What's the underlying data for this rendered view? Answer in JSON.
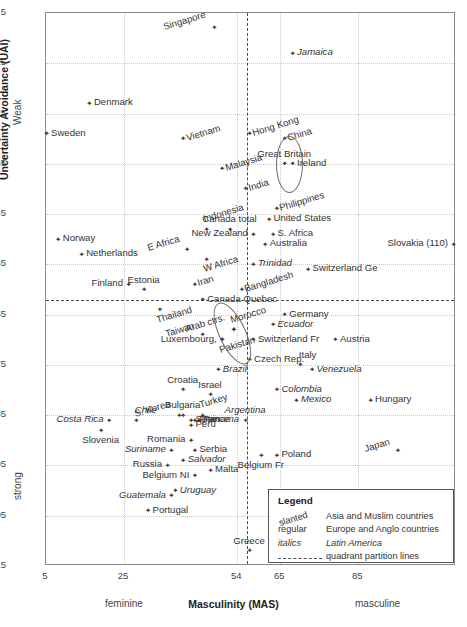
{
  "chart_data": {
    "type": "scatter",
    "title": "",
    "xlabel": "Masculinity (MAS)",
    "ylabel": "Uncertainty Avoidance (UAI)",
    "xlim": [
      5,
      110
    ],
    "ylim": [
      5,
      115
    ],
    "y_inverted": true,
    "xticks": [
      5,
      25,
      54,
      65,
      85
    ],
    "yticks": [
      5,
      15,
      25,
      35,
      45,
      55,
      65,
      75,
      85,
      95,
      105,
      115
    ],
    "x_axis_ends": {
      "low": "feminine",
      "high": "masculine"
    },
    "y_axis_ends": {
      "low": "Weak",
      "high": "strong"
    },
    "grid": true,
    "partition_lines": {
      "x": 56.5,
      "y": 62
    },
    "legend_position": "bottom-right",
    "points": [
      {
        "label": "Singapore",
        "x": 48,
        "y": 8,
        "style": "slanted",
        "pos": "left"
      },
      {
        "label": "Jamaica",
        "x": 68,
        "y": 13,
        "style": "italics",
        "pos": "right"
      },
      {
        "label": "Denmark",
        "x": 16,
        "y": 23,
        "style": "regular",
        "pos": "right"
      },
      {
        "label": "Sweden",
        "x": 5,
        "y": 29,
        "style": "regular",
        "pos": "right"
      },
      {
        "label": "Vietnam",
        "x": 40,
        "y": 30,
        "style": "slanted",
        "pos": "right"
      },
      {
        "label": "Hong Kong",
        "x": 57,
        "y": 29,
        "style": "slanted",
        "pos": "right"
      },
      {
        "label": "China",
        "x": 66,
        "y": 30,
        "style": "slanted",
        "pos": "right"
      },
      {
        "label": "Great Britain",
        "x": 66,
        "y": 35,
        "style": "regular",
        "pos": "above-c"
      },
      {
        "label": "Ireland",
        "x": 68,
        "y": 35,
        "style": "regular",
        "pos": "right"
      },
      {
        "label": "Malaysia",
        "x": 50,
        "y": 36,
        "style": "slanted",
        "pos": "right"
      },
      {
        "label": "India",
        "x": 56,
        "y": 40,
        "style": "slanted",
        "pos": "right"
      },
      {
        "label": "Philippines",
        "x": 64,
        "y": 44,
        "style": "slanted",
        "pos": "right"
      },
      {
        "label": "Indonesia",
        "x": 46,
        "y": 48,
        "style": "slanted",
        "pos": "above"
      },
      {
        "label": "Canada total",
        "x": 52,
        "y": 48,
        "style": "regular",
        "pos": "above-c"
      },
      {
        "label": "United States",
        "x": 62,
        "y": 46,
        "style": "regular",
        "pos": "right"
      },
      {
        "label": "Norway",
        "x": 8,
        "y": 50,
        "style": "regular",
        "pos": "right"
      },
      {
        "label": "New Zealand",
        "x": 58,
        "y": 49,
        "style": "regular",
        "pos": "left"
      },
      {
        "label": "S. Africa",
        "x": 63,
        "y": 49,
        "style": "regular",
        "pos": "right"
      },
      {
        "label": "Australia",
        "x": 61,
        "y": 51,
        "style": "regular",
        "pos": "right"
      },
      {
        "label": "E Africa",
        "x": 41,
        "y": 52,
        "style": "slanted",
        "pos": "left"
      },
      {
        "label": "Slovakia (110)",
        "x": 110,
        "y": 51,
        "style": "regular",
        "pos": "left"
      },
      {
        "label": "Netherlands",
        "x": 14,
        "y": 53,
        "style": "regular",
        "pos": "right"
      },
      {
        "label": "W Africa",
        "x": 46,
        "y": 54,
        "style": "slanted",
        "pos": "below"
      },
      {
        "label": "Trinidad",
        "x": 58,
        "y": 55,
        "style": "italics",
        "pos": "right"
      },
      {
        "label": "Switzerland Ge",
        "x": 72,
        "y": 56,
        "style": "regular",
        "pos": "right"
      },
      {
        "label": "Iran",
        "x": 43,
        "y": 59,
        "style": "slanted",
        "pos": "right"
      },
      {
        "label": "Finland",
        "x": 26,
        "y": 59,
        "style": "regular",
        "pos": "left"
      },
      {
        "label": "Estonia",
        "x": 30,
        "y": 60,
        "style": "regular",
        "pos": "above-c"
      },
      {
        "label": "Bangladesh",
        "x": 55,
        "y": 60,
        "style": "slanted",
        "pos": "right"
      },
      {
        "label": "Canada Quebec",
        "x": 45,
        "y": 62,
        "style": "regular",
        "pos": "right"
      },
      {
        "label": "Thailand",
        "x": 34,
        "y": 64,
        "style": "slanted",
        "pos": "below"
      },
      {
        "label": "Morocco",
        "x": 53,
        "y": 68,
        "style": "slanted",
        "pos": "above"
      },
      {
        "label": "Germany",
        "x": 66,
        "y": 65,
        "style": "regular",
        "pos": "right"
      },
      {
        "label": "Arab ctrs.",
        "x": 53,
        "y": 68,
        "style": "slanted",
        "pos": "left"
      },
      {
        "label": "Ecuador",
        "x": 63,
        "y": 67,
        "style": "italics",
        "pos": "right"
      },
      {
        "label": "Taiwan",
        "x": 45,
        "y": 69,
        "style": "slanted",
        "pos": "left"
      },
      {
        "label": "Pakistan",
        "x": 50,
        "y": 70,
        "style": "slanted",
        "pos": "below"
      },
      {
        "label": "Switzerland Fr",
        "x": 58,
        "y": 70,
        "style": "regular",
        "pos": "right"
      },
      {
        "label": "Austria",
        "x": 79,
        "y": 70,
        "style": "regular",
        "pos": "right"
      },
      {
        "label": "Luxembourg,",
        "x": 50,
        "y": 70,
        "style": "regular",
        "pos": "left"
      },
      {
        "label": "Czech Rep.",
        "x": 57,
        "y": 74,
        "style": "regular",
        "pos": "right"
      },
      {
        "label": "Italy",
        "x": 70,
        "y": 75,
        "style": "regular",
        "pos": "above"
      },
      {
        "label": "Brazil",
        "x": 49,
        "y": 76,
        "style": "italics",
        "pos": "right"
      },
      {
        "label": "Venezuela",
        "x": 73,
        "y": 76,
        "style": "italics",
        "pos": "right"
      },
      {
        "label": "Croatia",
        "x": 40,
        "y": 80,
        "style": "regular",
        "pos": "above-c"
      },
      {
        "label": "Israel",
        "x": 47,
        "y": 81,
        "style": "regular",
        "pos": "above-c"
      },
      {
        "label": "Colombia",
        "x": 64,
        "y": 80,
        "style": "italics",
        "pos": "right"
      },
      {
        "label": "Mexico",
        "x": 69,
        "y": 82,
        "style": "italics",
        "pos": "right"
      },
      {
        "label": "Hungary",
        "x": 88,
        "y": 82,
        "style": "regular",
        "pos": "right"
      },
      {
        "label": "Bulgaria",
        "x": 40,
        "y": 85,
        "style": "regular",
        "pos": "above-c"
      },
      {
        "label": "Turkey",
        "x": 45,
        "y": 85,
        "style": "slanted",
        "pos": "above"
      },
      {
        "label": "Chile",
        "x": 28,
        "y": 86,
        "style": "italics",
        "pos": "above"
      },
      {
        "label": "Costa Rica",
        "x": 21,
        "y": 86,
        "style": "italics",
        "pos": "left"
      },
      {
        "label": "Argentina",
        "x": 56,
        "y": 86,
        "style": "italics",
        "pos": "above-c"
      },
      {
        "label": "S. Korea",
        "x": 39,
        "y": 85,
        "style": "slanted",
        "pos": "left"
      },
      {
        "label": "France",
        "x": 43,
        "y": 86,
        "style": "regular",
        "pos": "right"
      },
      {
        "label": "Slovenia",
        "x": 19,
        "y": 88,
        "style": "regular",
        "pos": "below-c"
      },
      {
        "label": "Peru",
        "x": 42,
        "y": 87,
        "style": "left"
      },
      {
        "label": "Spain",
        "x": 42,
        "y": 86,
        "style": "regular",
        "pos": "right"
      },
      {
        "label": "Panama",
        "x": 44,
        "y": 86,
        "style": "italics",
        "pos": "right"
      },
      {
        "label": "Romania",
        "x": 42,
        "y": 90,
        "style": "regular",
        "pos": "left"
      },
      {
        "label": "Suriname",
        "x": 37,
        "y": 92,
        "style": "italics",
        "pos": "left"
      },
      {
        "label": "Serbia",
        "x": 43,
        "y": 92,
        "style": "regular",
        "pos": "right"
      },
      {
        "label": "Russia",
        "x": 36,
        "y": 95,
        "style": "regular",
        "pos": "left"
      },
      {
        "label": "Salvador",
        "x": 40,
        "y": 94,
        "style": "italics",
        "pos": "right"
      },
      {
        "label": "Belgium NI",
        "x": 43,
        "y": 97,
        "style": "regular",
        "pos": "left"
      },
      {
        "label": "Malta",
        "x": 47,
        "y": 96,
        "style": "regular",
        "pos": "right"
      },
      {
        "label": "Belgium Fr",
        "x": 60,
        "y": 93,
        "style": "regular",
        "pos": "below-c"
      },
      {
        "label": "Poland",
        "x": 64,
        "y": 93,
        "style": "regular",
        "pos": "right"
      },
      {
        "label": "Japan",
        "x": 95,
        "y": 92,
        "style": "slanted",
        "pos": "left"
      },
      {
        "label": "Guatemala",
        "x": 37,
        "y": 101,
        "style": "italics",
        "pos": "left"
      },
      {
        "label": "Uruguay",
        "x": 38,
        "y": 100,
        "style": "italics",
        "pos": "right"
      },
      {
        "label": "Portugal",
        "x": 31,
        "y": 104,
        "style": "regular",
        "pos": "right"
      },
      {
        "label": "Greece",
        "x": 57,
        "y": 112,
        "style": "regular",
        "pos": "above-c"
      }
    ],
    "annotations": [
      {
        "type": "ellipse",
        "center_x": 67,
        "center_y": 35,
        "rx": 3.2,
        "ry": 5.5
      },
      {
        "type": "ellipse",
        "center_x": 52.5,
        "center_y": 68.5,
        "rx": 3.2,
        "ry": 6.5,
        "rotate": -25
      }
    ]
  },
  "legend": {
    "title": "Legend",
    "rows": [
      {
        "key": "slanted",
        "value": "Asia and Muslim countries",
        "key_style": "slanted",
        "value_style": "regular"
      },
      {
        "key": "regular",
        "value": "Europe and Anglo countries",
        "key_style": "regular",
        "value_style": "regular"
      },
      {
        "key": "italics",
        "value": "Latin America",
        "key_style": "italics",
        "value_style": "italics"
      },
      {
        "key": "dash-line",
        "value": "quadrant partition lines",
        "key_style": "dash",
        "value_style": "regular"
      }
    ]
  }
}
